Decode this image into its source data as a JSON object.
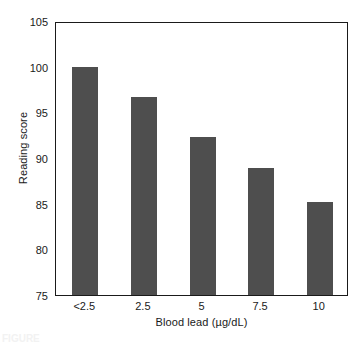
{
  "chart_data": {
    "type": "bar",
    "title": "",
    "xlabel": "Blood lead (µg/dL)",
    "ylabel": "Reading score",
    "categories": [
      "<2.5",
      "2.5",
      "5",
      "7.5",
      "10"
    ],
    "values": [
      100.0,
      96.7,
      92.3,
      88.9,
      85.2
    ],
    "ylim": [
      75,
      105
    ],
    "yticks": [
      75,
      80,
      85,
      90,
      95,
      100,
      105
    ],
    "ytick_labels": [
      "75",
      "80",
      "85",
      "90",
      "95",
      "100",
      "105"
    ],
    "grid": false,
    "legend": null,
    "bar_color": "#4e4e4e",
    "axis_color": "#1a1a1a",
    "background": "#ffffff"
  },
  "caption": {
    "remnant": "FIGURE"
  }
}
